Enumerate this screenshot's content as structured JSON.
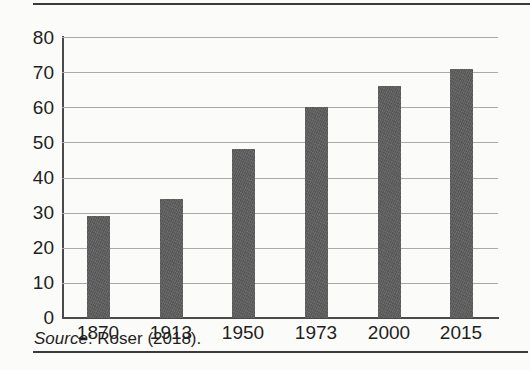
{
  "figure": {
    "source_note_prefix": "Source",
    "source_note_rest": ": Roser (2018)."
  },
  "chart_data": {
    "type": "bar",
    "title": "",
    "subtitle": "",
    "xlabel": "",
    "ylabel": "",
    "categories": [
      "1870",
      "1913",
      "1950",
      "1973",
      "2000",
      "2015"
    ],
    "values": [
      29,
      34,
      48,
      60,
      66,
      71
    ],
    "series": [
      {
        "name": "",
        "values": [
          29,
          34,
          48,
          60,
          66,
          71
        ]
      }
    ],
    "ylim": [
      0,
      80
    ],
    "ytick_labels": [
      "80",
      "70",
      "60",
      "50",
      "40",
      "30",
      "20",
      "10",
      "0"
    ],
    "ytick_values": [
      80,
      70,
      60,
      50,
      40,
      30,
      20,
      10,
      0
    ],
    "ytick_step": 10,
    "grid": "horizontal",
    "legend": "none",
    "annotations": [
      "Source: Roser (2018)."
    ],
    "colors": {
      "bar": "#5e5e5e",
      "gridline": "#a9a9a9",
      "axis": "#4a4a4a",
      "text": "#231f20",
      "background": "#fbfbfa",
      "rule": "#3a3a3a"
    }
  }
}
